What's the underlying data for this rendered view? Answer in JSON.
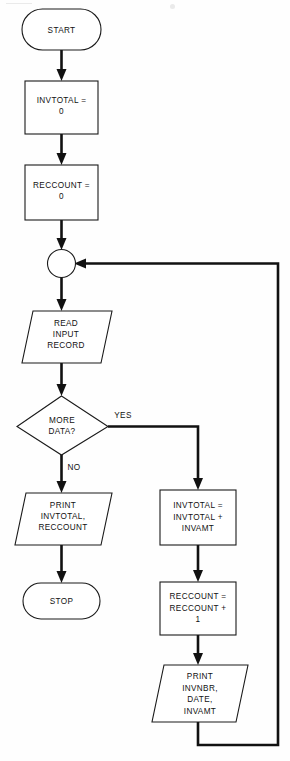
{
  "diagram": {
    "background_color": "#fefefe",
    "line_color": "#111111",
    "shape_fill": "#ffffff",
    "shape_stroke": "#1a1a1a"
  },
  "nodes": {
    "start": {
      "label": "START",
      "shape": "terminator"
    },
    "init_invtotal": {
      "line1": "INVTOTAL =",
      "line2": "0",
      "shape": "process"
    },
    "init_reccount": {
      "line1": "RECCOUNT =",
      "line2": "0",
      "shape": "process"
    },
    "loop_connector": {
      "label": "",
      "shape": "connector"
    },
    "read_record": {
      "line1": "READ",
      "line2": "INPUT",
      "line3": "RECORD",
      "shape": "input-output"
    },
    "decision_more_data": {
      "line1": "MORE",
      "line2": "DATA?",
      "shape": "decision"
    },
    "print_totals": {
      "line1": "PRINT",
      "line2": "INVTOTAL,",
      "line3": "RECCOUNT",
      "shape": "input-output"
    },
    "stop": {
      "label": "STOP",
      "shape": "terminator"
    },
    "accumulate_invtotal": {
      "line1": "INVTOTAL =",
      "line2": "INVTOTAL +",
      "line3": "INVAMT",
      "shape": "process"
    },
    "increment_reccount": {
      "line1": "RECCOUNT =",
      "line2": "RECCOUNT +",
      "line3": "1",
      "shape": "process"
    },
    "print_detail": {
      "line1": "PRINT",
      "line2": "INVNBR,",
      "line3": "DATE,",
      "line4": "INVAMT",
      "shape": "input-output"
    }
  },
  "edge_labels": {
    "yes": "YES",
    "no": "NO"
  }
}
